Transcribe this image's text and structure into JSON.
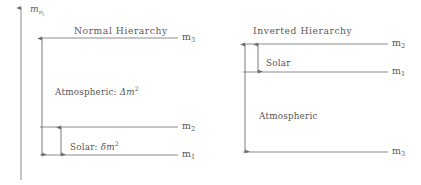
{
  "figure": {
    "kind": "neutrino-mass-hierarchy-diagram",
    "background_color": "#ffffff",
    "line_color": "#8c8c8c",
    "text_color": "#555555",
    "width": 421,
    "height": 185
  },
  "axis": {
    "label_main": "m",
    "label_sub": "ν",
    "label_subsub": "i",
    "orientation": "vertical",
    "arrow_direction": "up",
    "x": 21,
    "y_top": 8,
    "y_bottom": 180
  },
  "panels": [
    {
      "id": "normal-hierarchy",
      "title": "Normal Hierarchy",
      "title_x": 74,
      "title_y": 26,
      "level_x_start": 40,
      "level_x_end": 178,
      "arrow_x_outer": 42,
      "arrow_x_inner": 61,
      "levels": [
        {
          "id": "m3",
          "label_main": "m",
          "label_sub": "3",
          "y": 38,
          "label_x": 182
        },
        {
          "id": "m2",
          "label_main": "m",
          "label_sub": "2",
          "y": 127,
          "label_x": 182
        },
        {
          "id": "m1",
          "label_main": "m",
          "label_sub": "1",
          "y": 155,
          "label_x": 182
        }
      ],
      "splittings": [
        {
          "id": "atmospheric",
          "text_plain": "Atmospheric:",
          "symbol_delta": "Δ",
          "symbol_m": "m",
          "symbol_exp": "2",
          "from_y": 38,
          "to_y": 155,
          "arrow_x": 42,
          "label_x": 55,
          "label_y": 88
        },
        {
          "id": "solar",
          "text_plain": "Solar:",
          "symbol_delta": "δ",
          "symbol_m": "m",
          "symbol_exp": "2",
          "from_y": 127,
          "to_y": 155,
          "arrow_x": 61,
          "label_x": 70,
          "label_y": 143
        }
      ]
    },
    {
      "id": "inverted-hierarchy",
      "title": "Inverted Hierarchy",
      "title_x": 253,
      "title_y": 26,
      "level_x_start": 243,
      "level_x_end": 388,
      "arrow_x_outer": 245,
      "arrow_x_inner": 258,
      "levels": [
        {
          "id": "m2",
          "label_main": "m",
          "label_sub": "2",
          "y": 44,
          "label_x": 392
        },
        {
          "id": "m1",
          "label_main": "m",
          "label_sub": "1",
          "y": 72,
          "label_x": 392
        },
        {
          "id": "m3",
          "label_main": "m",
          "label_sub": "3",
          "y": 152,
          "label_x": 392
        }
      ],
      "splittings": [
        {
          "id": "solar",
          "text_plain": "Solar",
          "symbol_delta": "",
          "symbol_m": "",
          "symbol_exp": "",
          "from_y": 44,
          "to_y": 72,
          "arrow_x": 258,
          "label_x": 266,
          "label_y": 59
        },
        {
          "id": "atmospheric",
          "text_plain": "Atmospheric",
          "symbol_delta": "",
          "symbol_m": "",
          "symbol_exp": "",
          "from_y": 44,
          "to_y": 152,
          "arrow_x": 245,
          "label_x": 259,
          "label_y": 112
        }
      ]
    }
  ],
  "chart_data": {
    "type": "diagram",
    "title": "",
    "ylabel": "m_{ν_i}",
    "panels": [
      {
        "name": "Normal Hierarchy",
        "states_top_to_bottom": [
          "m3",
          "m2",
          "m1"
        ],
        "level_y_px": {
          "m3": 38,
          "m2": 127,
          "m1": 155
        },
        "splittings": [
          {
            "name": "Atmospheric: Δm²",
            "between": [
              "m3",
              "m1"
            ]
          },
          {
            "name": "Solar: δm²",
            "between": [
              "m2",
              "m1"
            ]
          }
        ]
      },
      {
        "name": "Inverted Hierarchy",
        "states_top_to_bottom": [
          "m2",
          "m1",
          "m3"
        ],
        "level_y_px": {
          "m2": 44,
          "m1": 72,
          "m3": 152
        },
        "splittings": [
          {
            "name": "Solar",
            "between": [
              "m2",
              "m1"
            ]
          },
          {
            "name": "Atmospheric",
            "between": [
              "m2",
              "m3"
            ]
          }
        ]
      }
    ]
  }
}
